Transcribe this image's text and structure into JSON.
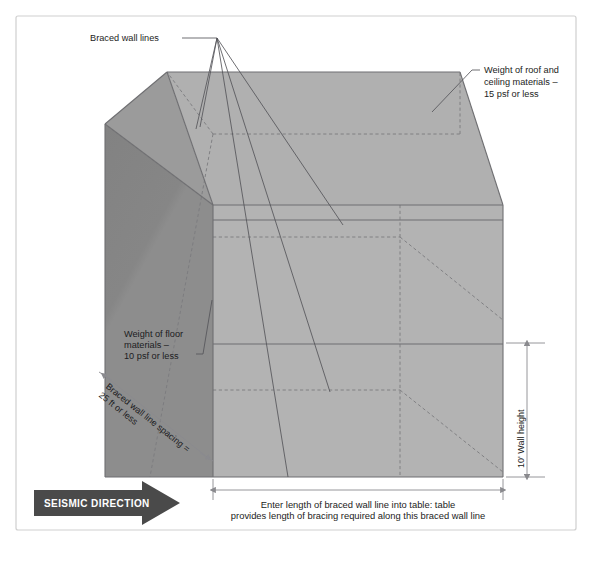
{
  "figure": {
    "background_color": "#ffffff",
    "frame": {
      "border_color": "#cfcfcf",
      "fill": "#ffffff"
    },
    "palette": {
      "roof_light": "#b0b0b0",
      "roof_dark": "#999999",
      "front_wall": "#b3b3b3",
      "side_wall": "#8d8d8d",
      "side_wall_dark": "#828282",
      "outline": "#6f6f72",
      "dashed": "#7a7a7e",
      "leader": "#55555a",
      "dimension": "#8a8a8e",
      "arrow_fill": "#4a4a4a",
      "text": "#1c1c22"
    },
    "labels": {
      "braced_wall_lines": "Braced wall lines",
      "roof_weight_line1": "Weight of roof and",
      "roof_weight_line2": "ceiling materials –",
      "roof_weight_line3": "15 psf or less",
      "floor_weight_line1": "Weight of floor",
      "floor_weight_line2": "materials –",
      "floor_weight_line3": "10 psf or less",
      "spacing_line1": "Braced wall line spacing =",
      "spacing_line2": "25 ft or less",
      "wall_height": "10' Wall height",
      "seismic_direction": "SEISMIC DIRECTION",
      "caption_line1": "Enter  length of braced wall line into table: table",
      "caption_line2": "provides length of bracing required along this braced wall line"
    }
  }
}
